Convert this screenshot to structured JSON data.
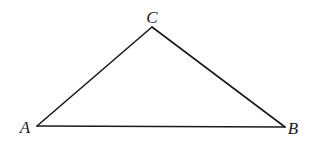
{
  "diagram": {
    "type": "triangle",
    "stroke_color": "#1a1a1a",
    "background": "#ffffff",
    "vertices": {
      "A": {
        "label": "A",
        "x": 37,
        "y": 126,
        "label_x": 25,
        "label_y": 133
      },
      "B": {
        "label": "B",
        "x": 285,
        "y": 127,
        "label_x": 293,
        "label_y": 134
      },
      "C": {
        "label": "C",
        "x": 152,
        "y": 27,
        "label_x": 152,
        "label_y": 23
      }
    },
    "edges": [
      {
        "from": "A",
        "to": "B"
      },
      {
        "from": "B",
        "to": "C"
      },
      {
        "from": "C",
        "to": "A"
      }
    ]
  }
}
